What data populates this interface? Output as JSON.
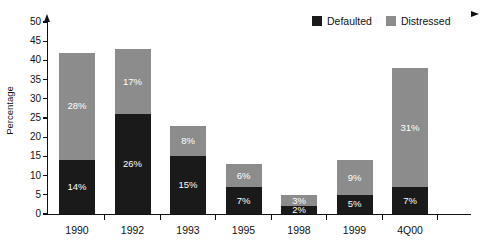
{
  "chart_data": {
    "type": "bar",
    "subtype": "stacked-bar",
    "title": "",
    "xlabel": "",
    "ylabel": "Percentage",
    "ylim": [
      0,
      50
    ],
    "ytick_step": 5,
    "ytick_labels": [
      "0",
      "5",
      "10",
      "15",
      "20",
      "25",
      "30",
      "35",
      "40",
      "45",
      "50"
    ],
    "grid": false,
    "legend_position": "top-right",
    "categories": [
      "1990",
      "1992",
      "1993",
      "1995",
      "1998",
      "1999",
      "4Q00"
    ],
    "series": [
      {
        "name": "Defaulted",
        "color": "#1a1a1a",
        "values": [
          14,
          26,
          15,
          7,
          2,
          5,
          7
        ],
        "labels": [
          "14%",
          "26%",
          "15%",
          "7%",
          "2%",
          "5%",
          "7%"
        ]
      },
      {
        "name": "Distressed",
        "color": "#8c8c8c",
        "values": [
          28,
          17,
          8,
          6,
          3,
          9,
          31
        ],
        "labels": [
          "28%",
          "17%",
          "8%",
          "6%",
          "3%",
          "9%",
          "31%"
        ]
      }
    ],
    "totals": [
      42,
      43,
      23,
      13,
      5,
      14,
      38
    ]
  },
  "legend": {
    "items": [
      {
        "label": "Defaulted",
        "color": "#1a1a1a"
      },
      {
        "label": "Distressed",
        "color": "#8c8c8c"
      }
    ]
  },
  "axis": {
    "y_title": "Percentage"
  }
}
